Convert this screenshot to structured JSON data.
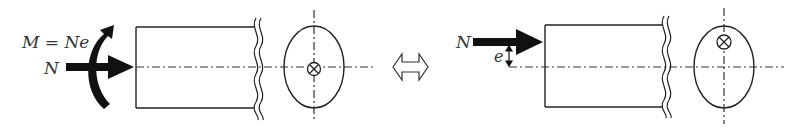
{
  "diagram": {
    "left": {
      "moment_label": "M = Ne",
      "force_label": "N",
      "section_symbol": "⊗"
    },
    "equivalence_symbol": "⇔",
    "right": {
      "force_label": "N",
      "eccentricity_label": "e",
      "section_symbol": "⊗"
    },
    "colors": {
      "stroke": "#222222",
      "fill_arrow": "#111111",
      "text": "#333333",
      "background": "#ffffff"
    }
  }
}
